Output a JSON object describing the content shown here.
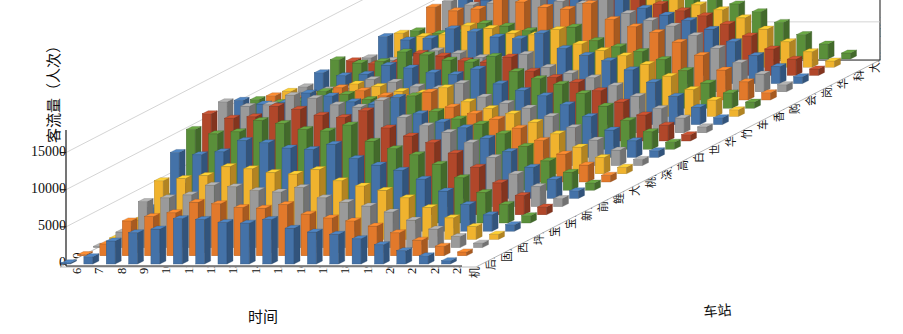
{
  "chart_data": {
    "type": "bar",
    "subtype": "3d-column",
    "title": "",
    "xlabel": "时间",
    "ylabel": "客流量（人次）",
    "zlabel": "车站",
    "ylim": [
      0,
      17500
    ],
    "y_ticks": [
      "0",
      "5000",
      "10000",
      "15000"
    ],
    "y_tick_values": [
      0,
      5000,
      10000,
      15000
    ],
    "grid": true,
    "legend": "none",
    "categories": [
      "6:00",
      "7:00",
      "8:00",
      "9:00",
      "10:00",
      "11:00",
      "12:00",
      "13:00",
      "14:00",
      "15:00",
      "16:00",
      "17:00",
      "18:00",
      "19:00",
      "20:00",
      "21:00",
      "22:00",
      "23:00"
    ],
    "series_axis": "车站",
    "series_colors": [
      "#4472a8",
      "#e2792b",
      "#9a9a9a",
      "#f0b32e",
      "#4472a8",
      "#5a8f3a",
      "#b1472a",
      "#3f6f9e",
      "#d9a33a",
      "#6f8f4f",
      "#8c5a3c",
      "#5f7fb0"
    ],
    "series": [
      {
        "name": "机场东-后瑞",
        "color": "#4472a8",
        "values": [
          120,
          980,
          3100,
          4200,
          4700,
          6100,
          6000,
          5600,
          5500,
          6000,
          4800,
          4300,
          4000,
          3400,
          2600,
          1800,
          1100,
          450
        ]
      },
      {
        "name": "后瑞-固戍",
        "color": "#e2792b",
        "values": [
          150,
          1600,
          4700,
          5300,
          5800,
          7200,
          7000,
          6500,
          6400,
          6900,
          5600,
          5100,
          4700,
          4000,
          3100,
          2100,
          1300,
          520
        ]
      },
      {
        "name": "固戍-西乡",
        "color": "#9a9a9a",
        "values": [
          180,
          2100,
          6200,
          6700,
          7100,
          8400,
          8200,
          7700,
          7500,
          8100,
          6700,
          6100,
          5600,
          4800,
          3700,
          2500,
          1500,
          600
        ]
      },
      {
        "name": "西乡-坪洲",
        "color": "#f0b32e",
        "values": [
          200,
          2600,
          7900,
          8200,
          8600,
          9800,
          9500,
          9000,
          8800,
          9400,
          7900,
          7200,
          6600,
          5600,
          4300,
          2900,
          1750,
          700
        ]
      },
      {
        "name": "坪洲-宝体",
        "color": "#4472a8",
        "values": [
          230,
          3200,
          10600,
          10300,
          10700,
          12200,
          11900,
          11200,
          11000,
          11700,
          9800,
          8900,
          8200,
          7000,
          5400,
          3600,
          2200,
          880
        ]
      },
      {
        "name": "宝体-宝安中心",
        "color": "#5a8f3a",
        "values": [
          260,
          3600,
          12600,
          12000,
          12300,
          13800,
          13400,
          12600,
          12400,
          13200,
          11000,
          10000,
          9200,
          7900,
          6100,
          4100,
          2500,
          990
        ]
      },
      {
        "name": "宝安中心-新安",
        "color": "#b1472a",
        "values": [
          280,
          3900,
          13600,
          13000,
          13200,
          14600,
          14200,
          13400,
          13100,
          14000,
          11700,
          10600,
          9700,
          8300,
          6400,
          4300,
          2600,
          1040
        ]
      },
      {
        "name": "新安-前海湾",
        "color": "#9a9a9a",
        "values": [
          300,
          4100,
          14100,
          13500,
          13700,
          15000,
          14600,
          13700,
          13400,
          14300,
          12000,
          10900,
          10000,
          8600,
          6600,
          4400,
          2700,
          1080
        ]
      },
      {
        "name": "前海湾-鲤鱼门",
        "color": "#4472a8",
        "values": [
          290,
          3800,
          13200,
          12700,
          12900,
          14200,
          13800,
          13000,
          12700,
          13600,
          11400,
          10300,
          9500,
          8100,
          6300,
          4200,
          2550,
          1020
        ]
      },
      {
        "name": "鲤鱼门-大新",
        "color": "#5a8f3a",
        "values": [
          270,
          3500,
          12200,
          11800,
          12000,
          13300,
          12900,
          12200,
          11900,
          12700,
          10600,
          9600,
          8900,
          7600,
          5900,
          3950,
          2400,
          960
        ]
      },
      {
        "name": "大新-桃园",
        "color": "#e2792b",
        "values": [
          255,
          3300,
          11600,
          11200,
          11400,
          12700,
          12300,
          11600,
          11400,
          12100,
          10100,
          9200,
          8450,
          7250,
          5600,
          3760,
          2280,
          910
        ]
      },
      {
        "name": "桃园-深大",
        "color": "#f0b32e",
        "values": [
          245,
          3150,
          11100,
          10700,
          10900,
          12100,
          11750,
          11100,
          10900,
          11600,
          9700,
          8800,
          8100,
          6950,
          5380,
          3600,
          2190,
          875
        ]
      },
      {
        "name": "深大-高新园",
        "color": "#9a9a9a",
        "values": [
          235,
          3000,
          10600,
          10200,
          10400,
          11600,
          11250,
          10600,
          10400,
          11100,
          9250,
          8400,
          7750,
          6650,
          5140,
          3440,
          2090,
          835
        ]
      },
      {
        "name": "高新园-白石洲",
        "color": "#4472a8",
        "values": [
          250,
          3250,
          11400,
          11000,
          11200,
          12400,
          12050,
          11400,
          11150,
          11900,
          9900,
          9000,
          8300,
          7100,
          5500,
          3680,
          2240,
          895
        ]
      },
      {
        "name": "白石洲-世界之窗",
        "color": "#5a8f3a",
        "values": [
          265,
          3450,
          12050,
          11600,
          11800,
          13100,
          12700,
          12000,
          11750,
          12500,
          10450,
          9500,
          8750,
          7500,
          5800,
          3880,
          2360,
          945
        ]
      },
      {
        "name": "世界之窗-华侨城",
        "color": "#b1472a",
        "values": [
          240,
          3050,
          10800,
          10400,
          10600,
          11800,
          11450,
          10800,
          10600,
          11300,
          9400,
          8550,
          7900,
          6780,
          5240,
          3505,
          2130,
          852
        ]
      },
      {
        "name": "华侨城-竹子林",
        "color": "#9a9a9a",
        "values": [
          225,
          2850,
          10100,
          9750,
          9950,
          11050,
          10720,
          10120,
          9930,
          10580,
          8820,
          8020,
          7400,
          6350,
          4910,
          3285,
          1995,
          798
        ]
      },
      {
        "name": "竹子林-车公庙",
        "color": "#4472a8",
        "values": [
          260,
          3380,
          11850,
          11400,
          11600,
          12900,
          12500,
          11800,
          11550,
          12300,
          10250,
          9320,
          8600,
          7370,
          5700,
          3815,
          2320,
          928
        ]
      },
      {
        "name": "车公庙-香蜜湖",
        "color": "#f0b32e",
        "values": [
          248,
          3180,
          11200,
          10800,
          11000,
          12200,
          11850,
          11200,
          10980,
          11700,
          9760,
          8870,
          8180,
          7010,
          5420,
          3630,
          2205,
          882
        ]
      },
      {
        "name": "香蜜湖-购物公园",
        "color": "#5a8f3a",
        "values": [
          232,
          2950,
          10420,
          10050,
          10250,
          11400,
          11060,
          10440,
          10240,
          10920,
          9100,
          8270,
          7630,
          6540,
          5060,
          3385,
          2055,
          822
        ]
      },
      {
        "name": "购物公园-会展中心",
        "color": "#e2792b",
        "values": [
          275,
          3580,
          12500,
          12000,
          12250,
          13600,
          13200,
          12470,
          12220,
          13000,
          10850,
          9860,
          9090,
          7790,
          6020,
          4030,
          2450,
          980
        ]
      },
      {
        "name": "会展中心-岗厦",
        "color": "#9a9a9a",
        "values": [
          268,
          3480,
          12180,
          11700,
          11950,
          13250,
          12860,
          12150,
          11900,
          12670,
          10570,
          9600,
          8860,
          7590,
          5870,
          3925,
          2385,
          954
        ]
      },
      {
        "name": "岗厦-华强路",
        "color": "#4472a8",
        "values": [
          258,
          3330,
          11700,
          11250,
          11480,
          12740,
          12360,
          11680,
          11440,
          12180,
          10160,
          9230,
          8510,
          7300,
          5640,
          3775,
          2295,
          918
        ]
      },
      {
        "name": "华强路-科学馆",
        "color": "#b1472a",
        "values": [
          246,
          3130,
          11020,
          10610,
          10820,
          12010,
          11650,
          11010,
          10780,
          11480,
          9580,
          8700,
          8020,
          6880,
          5320,
          3560,
          2165,
          866
        ]
      },
      {
        "name": "科学馆-大剧院",
        "color": "#f0b32e",
        "values": [
          238,
          3020,
          10640,
          10240,
          10440,
          11590,
          11240,
          10630,
          10410,
          11080,
          9240,
          8400,
          7740,
          6640,
          5130,
          3435,
          2090,
          835
        ]
      },
      {
        "name": "大剧院-国贸",
        "color": "#5a8f3a",
        "values": [
          228,
          2880,
          10180,
          9800,
          10000,
          11100,
          10760,
          10180,
          9970,
          10620,
          8860,
          8050,
          7420,
          6370,
          4930,
          3295,
          2005,
          802
        ]
      }
    ]
  },
  "axes": {
    "y_title": "客流量（人次）",
    "x_title": "时间",
    "z_title": "车站"
  }
}
